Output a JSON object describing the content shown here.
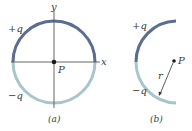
{
  "colors": {
    "positive_arc": "#5b6e90",
    "negative_arc": "#a8c5cb",
    "axis": "#555555",
    "point": "#1a1a1a",
    "text": "#3a3a3a"
  },
  "figure_a": {
    "caption": "(a)",
    "x_axis_label": "x",
    "y_axis_label": "y",
    "point_label": "P",
    "positive_label": "+q",
    "negative_label": "−q"
  },
  "figure_b": {
    "caption": "(b)",
    "point_label": "P",
    "radius_label": "r",
    "positive_label": "+q",
    "negative_label": "−q"
  }
}
